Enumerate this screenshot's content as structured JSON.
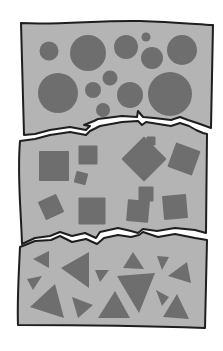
{
  "colors": {
    "background": "#ffffff",
    "panel_fill": "#b4b4b4",
    "shape_fill": "#6e6e6e",
    "outline": "#1e1e1e",
    "tear_gap": "#ffffff"
  },
  "panels": [
    {
      "id": "circles",
      "shape_type": "circle",
      "circles": [
        {
          "cx": 49,
          "cy": 51,
          "r": 9.5
        },
        {
          "cx": 88,
          "cy": 53,
          "r": 18
        },
        {
          "cx": 126,
          "cy": 47,
          "r": 12
        },
        {
          "cx": 146,
          "cy": 37,
          "r": 4.5
        },
        {
          "cx": 152,
          "cy": 58,
          "r": 11
        },
        {
          "cx": 182,
          "cy": 50,
          "r": 15
        },
        {
          "cx": 58,
          "cy": 93,
          "r": 20
        },
        {
          "cx": 93,
          "cy": 90,
          "r": 8
        },
        {
          "cx": 110,
          "cy": 78,
          "r": 7.5
        },
        {
          "cx": 130,
          "cy": 95,
          "r": 13
        },
        {
          "cx": 170,
          "cy": 94,
          "r": 22
        },
        {
          "cx": 103,
          "cy": 110,
          "r": 7
        }
      ]
    },
    {
      "id": "squares",
      "shape_type": "square",
      "squares": [
        {
          "cx": 54,
          "cy": 166,
          "size": 30,
          "rot": 0
        },
        {
          "cx": 88,
          "cy": 155,
          "size": 19,
          "rot": 0
        },
        {
          "cx": 144,
          "cy": 159,
          "size": 32,
          "rot": 45
        },
        {
          "cx": 151,
          "cy": 141,
          "size": 9,
          "rot": 0
        },
        {
          "cx": 184,
          "cy": 159,
          "size": 26,
          "rot": 20
        },
        {
          "cx": 81,
          "cy": 178,
          "size": 12,
          "rot": 15
        },
        {
          "cx": 146,
          "cy": 194,
          "size": 15,
          "rot": 0
        },
        {
          "cx": 51,
          "cy": 207,
          "size": 20,
          "rot": -25
        },
        {
          "cx": 92,
          "cy": 211,
          "size": 27,
          "rot": 0
        },
        {
          "cx": 138,
          "cy": 211,
          "size": 22,
          "rot": 5
        },
        {
          "cx": 175,
          "cy": 207,
          "size": 24,
          "rot": -5
        }
      ]
    },
    {
      "id": "triangles",
      "shape_type": "triangle",
      "triangles": [
        {
          "points": "33,259 49,251 49,268"
        },
        {
          "points": "61,268 89,252 89,288"
        },
        {
          "points": "27,279 42,276 33,290"
        },
        {
          "points": "30,307 55,284 64,318"
        },
        {
          "points": "72,297 93,305 78,318"
        },
        {
          "points": "95,270 109,270 100,282"
        },
        {
          "points": "98,318 115,291 130,318"
        },
        {
          "points": "123,268 133,252 144,269"
        },
        {
          "points": "117,276 155,273 139,313"
        },
        {
          "points": "157,256 169,257 162,270"
        },
        {
          "points": "168,276 187,262 191,283"
        },
        {
          "points": "156,290 169,297 162,306"
        },
        {
          "points": "163,317 177,294 189,319"
        }
      ]
    }
  ]
}
